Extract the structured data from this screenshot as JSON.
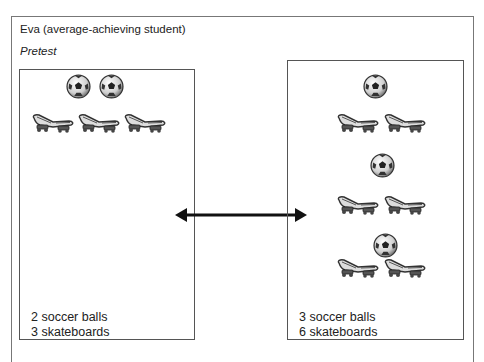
{
  "header": {
    "title": "Eva (average-achieving student)",
    "subtitle": "Pretest"
  },
  "left_panel": {
    "line1": "2 soccer balls",
    "line2": "3 skateboards",
    "soccer_balls": 2,
    "skateboards": 3
  },
  "right_panel": {
    "line1": "3 soccer balls",
    "line2": "6 skateboards",
    "soccer_balls": 3,
    "skateboards": 6
  },
  "connector": {
    "icon": "double-arrow-icon"
  }
}
